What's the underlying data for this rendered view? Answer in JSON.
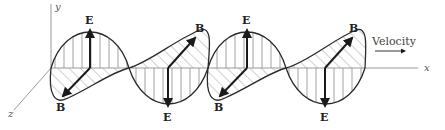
{
  "diagram": {
    "axes": {
      "x": "x",
      "y": "y",
      "z": "z"
    },
    "velocity_label": "Velocity",
    "labels": {
      "E1": "E",
      "B1": "B",
      "E2": "E",
      "B2": "B",
      "E3": "E",
      "B3": "B",
      "E4": "E",
      "B4": "B"
    },
    "colors": {
      "line": "#2a2a2a",
      "hatch": "#8a8a8a",
      "axis": "#9a9a9a"
    }
  }
}
